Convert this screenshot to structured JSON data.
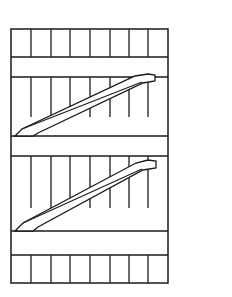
{
  "figure": {
    "title": "Escalator elevation line drawing",
    "background_color": "#ffffff",
    "line_color": "#1a1a1a",
    "slat_color": "#2b2b2b",
    "canvas": {
      "width": 232,
      "height": 297
    }
  },
  "frame": {
    "label": "outer frame",
    "x": 11,
    "y": 29,
    "width": 157,
    "height": 254,
    "left": 11,
    "right": 168,
    "top": 29,
    "bottom": 283
  },
  "deck_lines": {
    "label": "horizontal deck lines",
    "y_values": [
      57,
      77,
      136,
      156,
      231,
      255
    ]
  },
  "bands": [
    {
      "name": "top-slat-band",
      "top": 29,
      "bottom": 57,
      "tick_from_top": true,
      "tick_length": 28,
      "tick_count": 7
    },
    {
      "name": "upper-plenum-band",
      "top": 57,
      "bottom": 77,
      "tick_from_top": false,
      "tick_length": 0,
      "tick_count": 0
    },
    {
      "name": "upper-truss-band",
      "top": 77,
      "bottom": 136,
      "tick_from_top": true,
      "tick_length": 40,
      "tick_count": 7
    },
    {
      "name": "middle-plenum-band",
      "top": 136,
      "bottom": 156,
      "tick_from_top": false,
      "tick_length": 0,
      "tick_count": 0
    },
    {
      "name": "lower-truss-band",
      "top": 156,
      "bottom": 231,
      "tick_from_top": true,
      "tick_length": 52,
      "tick_count": 7
    },
    {
      "name": "lower-plenum-band",
      "top": 231,
      "bottom": 255,
      "tick_from_top": false,
      "tick_length": 0,
      "tick_count": 0
    },
    {
      "name": "bottom-slat-band",
      "top": 255,
      "bottom": 283,
      "tick_from_top": true,
      "tick_length": 28,
      "tick_count": 7
    }
  ],
  "slat_x_positions": [
    31,
    51,
    70,
    90,
    110,
    129,
    148
  ],
  "trusses": [
    {
      "name": "upper-escalator-truss",
      "direction": "lower-left-to-upper-right",
      "outline_points": "15,136 22,129 135,76 148,74 155,75 155,81 143,83 38,133 33,136",
      "crease_points": "22,129 142,82",
      "low_end_x": 15,
      "low_end_y": 136,
      "high_end_x": 155,
      "high_end_y": 75
    },
    {
      "name": "lower-escalator-truss",
      "direction": "lower-left-to-upper-right",
      "outline_points": "15,231 23,223 136,163 148,160 156,161 156,168 143,170 38,227 33,231",
      "crease_points": "23,223 142,169",
      "low_end_x": 15,
      "low_end_y": 231,
      "high_end_x": 156,
      "high_end_y": 161
    }
  ]
}
